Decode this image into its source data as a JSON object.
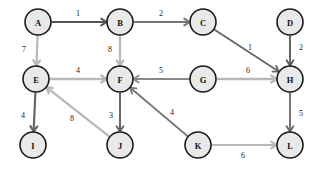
{
  "figure": {
    "kind": "directed-weighted-graph",
    "background_color": "#ffffff",
    "width": 323,
    "height": 171
  },
  "style": {
    "node_fill": "#e9e9e9",
    "node_stroke": "#1a1a1a",
    "node_radius": 13,
    "edge_dark": "#555555",
    "edge_medium": "#777777",
    "edge_light": "#b8b8b8",
    "label_color": "#1a1a1a"
  },
  "chart_data": {
    "type": "diagram",
    "title": "",
    "directed": true,
    "weighted": true,
    "nodes": [
      {
        "id": "A",
        "label": "A",
        "x": 38,
        "y": 22
      },
      {
        "id": "B",
        "label": "B",
        "x": 120,
        "y": 22
      },
      {
        "id": "C",
        "label": "C",
        "x": 203,
        "y": 22
      },
      {
        "id": "D",
        "label": "D",
        "x": 290,
        "y": 22
      },
      {
        "id": "E",
        "label": "E",
        "x": 36,
        "y": 79
      },
      {
        "id": "F",
        "label": "F",
        "x": 120,
        "y": 79
      },
      {
        "id": "G",
        "label": "G",
        "x": 203,
        "y": 79
      },
      {
        "id": "H",
        "label": "H",
        "x": 290,
        "y": 79
      },
      {
        "id": "I",
        "label": "I",
        "x": 33,
        "y": 145
      },
      {
        "id": "J",
        "label": "J",
        "x": 120,
        "y": 145
      },
      {
        "id": "K",
        "label": "K",
        "x": 198,
        "y": 145
      },
      {
        "id": "L",
        "label": "L",
        "x": 290,
        "y": 145
      }
    ],
    "edges": [
      {
        "from": "A",
        "to": "B",
        "weight": "1",
        "color": "#555555",
        "width": 2.0,
        "label_x": 78,
        "label_y": 13
      },
      {
        "from": "B",
        "to": "C",
        "weight": "2",
        "color": "#777777",
        "width": 2.0,
        "label_x": 161,
        "label_y": 13
      },
      {
        "from": "A",
        "to": "E",
        "weight": "7",
        "color": "#b8b8b8",
        "width": 2.2,
        "label_x": 24,
        "label_y": 49
      },
      {
        "from": "B",
        "to": "F",
        "weight": "8",
        "color": "#b8b8b8",
        "width": 2.2,
        "label_x": 110,
        "label_y": 49
      },
      {
        "from": "E",
        "to": "F",
        "weight": "4",
        "color": "#b8b8b8",
        "width": 2.4,
        "label_x": 78,
        "label_y": 70
      },
      {
        "from": "G",
        "to": "F",
        "weight": "5",
        "color": "#888888",
        "width": 1.8,
        "label_x": 161,
        "label_y": 70
      },
      {
        "from": "C",
        "to": "H",
        "weight": "1",
        "color": "#666666",
        "width": 1.8,
        "label_x": 250,
        "label_y": 47
      },
      {
        "from": "D",
        "to": "H",
        "weight": "2",
        "color": "#555555",
        "width": 1.8,
        "label_x": 301,
        "label_y": 47
      },
      {
        "from": "G",
        "to": "H",
        "weight": "6",
        "color": "#b8b8b8",
        "width": 2.4,
        "label_x": 248,
        "label_y": 70
      },
      {
        "from": "E",
        "to": "I",
        "weight": "4",
        "color": "#666666",
        "width": 2.2,
        "label_x": 23,
        "label_y": 115
      },
      {
        "from": "F",
        "to": "J",
        "weight": "3",
        "color": "#666666",
        "width": 2.0,
        "label_x": 111,
        "label_y": 115
      },
      {
        "from": "J",
        "to": "E",
        "weight": "8",
        "color": "#b8b8b8",
        "width": 2.4,
        "label_x": 72,
        "label_y": 118
      },
      {
        "from": "K",
        "to": "F",
        "weight": "4",
        "color": "#777777",
        "width": 1.8,
        "label_x": 172,
        "label_y": 112
      },
      {
        "from": "H",
        "to": "L",
        "weight": "5",
        "color": "#666666",
        "width": 1.8,
        "label_x": 301,
        "label_y": 113
      },
      {
        "from": "K",
        "to": "L",
        "weight": "6",
        "color": "#b8b8b8",
        "width": 2.2,
        "label_x": 243,
        "label_y": 155
      }
    ]
  }
}
